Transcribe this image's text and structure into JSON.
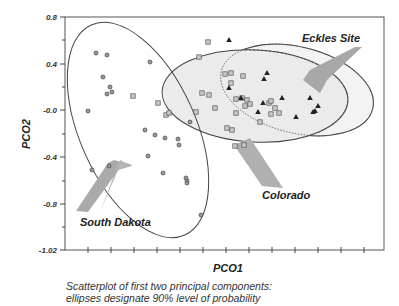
{
  "chart_data": {
    "type": "scatter",
    "title": "",
    "xlabel": "PCO1",
    "ylabel": "PCO2",
    "ylim": [
      -1.02,
      0.8
    ],
    "y_ticks": [
      "0.8",
      "0.4",
      "-0.0",
      "-0.4",
      "-0.8",
      "-1.02"
    ],
    "x_ticks_labeled": false,
    "grid": false,
    "caption_line1": "Scatterplot of first two principal components:",
    "caption_line2": "ellipses designate 90% level of probability",
    "annotations": [
      {
        "label": "South Dakota",
        "target": "south-dakota-ellipse"
      },
      {
        "label": "Colorado",
        "target": "colorado-ellipse"
      },
      {
        "label": "Eckles Site",
        "target": "eckles-ellipse"
      }
    ],
    "ellipses": [
      {
        "name": "South Dakota",
        "probability": 0.9,
        "style": "solid",
        "fill": "none"
      },
      {
        "name": "Colorado",
        "probability": 0.9,
        "style": "solid",
        "fill": "#ececec"
      },
      {
        "name": "Eckles Site",
        "probability": 0.9,
        "style": "solid",
        "fill": "#f2f2f2"
      }
    ],
    "series": [
      {
        "name": "South Dakota",
        "marker": "circle",
        "points_px": [
          [
            96,
            53
          ],
          [
            107,
            55
          ],
          [
            150,
            62
          ],
          [
            103,
            77
          ],
          [
            110,
            87
          ],
          [
            107,
            94
          ],
          [
            112,
            92
          ],
          [
            88,
            111
          ],
          [
            155,
            135
          ],
          [
            165,
            138
          ],
          [
            178,
            139
          ],
          [
            92,
            170
          ],
          [
            109,
            166
          ],
          [
            148,
            156
          ],
          [
            179,
            145
          ],
          [
            163,
            173
          ],
          [
            186,
            178
          ],
          [
            187,
            181
          ],
          [
            187,
            183
          ],
          [
            201,
            215
          ],
          [
            145,
            130
          ],
          [
            190,
            122
          ]
        ]
      },
      {
        "name": "Colorado",
        "marker": "square",
        "points_px": [
          [
            208,
            42
          ],
          [
            199,
            57
          ],
          [
            158,
            103
          ],
          [
            133,
            96
          ],
          [
            166,
            115
          ],
          [
            196,
            112
          ],
          [
            225,
            74
          ],
          [
            231,
            73
          ],
          [
            243,
            76
          ],
          [
            231,
            83
          ],
          [
            202,
            93
          ],
          [
            209,
            95
          ],
          [
            215,
            108
          ],
          [
            236,
            99
          ],
          [
            242,
            98
          ],
          [
            247,
            100
          ],
          [
            245,
            106
          ],
          [
            250,
            104
          ],
          [
            236,
            113
          ],
          [
            269,
            103
          ],
          [
            271,
            101
          ],
          [
            275,
            108
          ],
          [
            271,
            114
          ],
          [
            279,
            113
          ],
          [
            260,
            122
          ],
          [
            227,
            128
          ],
          [
            232,
            130
          ],
          [
            235,
            146
          ],
          [
            244,
            145
          ],
          [
            169,
            113
          ]
        ]
      },
      {
        "name": "Eckles Site",
        "marker": "triangle",
        "points_px": [
          [
            229,
            40
          ],
          [
            267,
            73
          ],
          [
            264,
            79
          ],
          [
            229,
            88
          ],
          [
            282,
            98
          ],
          [
            258,
            112
          ],
          [
            296,
            117
          ],
          [
            310,
            98
          ],
          [
            315,
            111
          ],
          [
            318,
            106
          ],
          [
            313,
            112
          ],
          [
            241,
            98
          ],
          [
            263,
            103
          ]
        ]
      }
    ]
  }
}
